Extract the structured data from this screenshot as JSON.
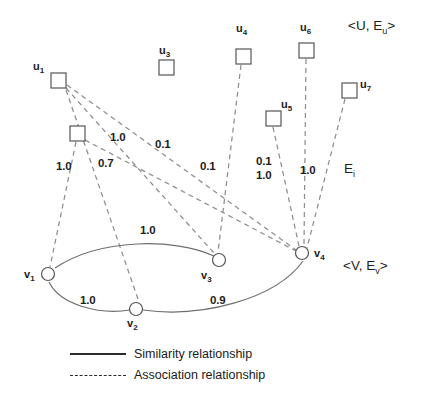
{
  "figure": {
    "colors": {
      "node_stroke": "#555555",
      "solid_edge": "#6e6e6e",
      "dashed_edge": "#8e8e8e",
      "text": "#1d1d1d"
    }
  },
  "set_labels": {
    "upper": {
      "text": "<U, E",
      "sub": "u",
      "tail": ">"
    },
    "middle": {
      "text": "E",
      "sub": "i",
      "tail": ""
    },
    "lower": {
      "text": "<V, E",
      "sub": "v",
      "tail": ">"
    }
  },
  "u_nodes": [
    {
      "id": "u1",
      "label": "u",
      "sub": "1",
      "x": 57,
      "y": 80,
      "show_label": true
    },
    {
      "id": "u2",
      "label": "u",
      "sub": "2",
      "x": 76,
      "y": 133,
      "show_label": false
    },
    {
      "id": "u3",
      "label": "u",
      "sub": "3",
      "x": 166,
      "y": 67,
      "show_label": true
    },
    {
      "id": "u4",
      "label": "u",
      "sub": "4",
      "x": 243,
      "y": 56,
      "show_label": true
    },
    {
      "id": "u5",
      "label": "u",
      "sub": "5",
      "x": 273,
      "y": 118,
      "show_label": true
    },
    {
      "id": "u6",
      "label": "u",
      "sub": "6",
      "x": 306,
      "y": 50,
      "show_label": true
    },
    {
      "id": "u7",
      "label": "u",
      "sub": "7",
      "x": 349,
      "y": 90,
      "show_label": true
    }
  ],
  "v_nodes": [
    {
      "id": "v1",
      "label": "v",
      "sub": "1",
      "x": 48,
      "y": 274
    },
    {
      "id": "v2",
      "label": "v",
      "sub": "2",
      "x": 136,
      "y": 309
    },
    {
      "id": "v3",
      "label": "v",
      "sub": "3",
      "x": 219,
      "y": 260
    },
    {
      "id": "v4",
      "label": "v",
      "sub": "4",
      "x": 302,
      "y": 253
    }
  ],
  "association_edges": [
    {
      "from": "u1",
      "to": "v3",
      "weight": "1.0"
    },
    {
      "from": "u1",
      "to": "v4",
      "weight": "0.1"
    },
    {
      "from": "u1",
      "to": "v2",
      "weight": "0.7"
    },
    {
      "from": "u2",
      "to": "v1",
      "weight": "1.0"
    },
    {
      "from": "u2",
      "to": "v4",
      "weight": "0.1"
    },
    {
      "from": "u4",
      "to": "v3",
      "weight": "0.1"
    },
    {
      "from": "u5",
      "to": "v4",
      "weight": "0.1"
    },
    {
      "from": "u6",
      "to": "v4",
      "weight": "1.0"
    },
    {
      "from": "u7",
      "to": "v4",
      "weight": "1.0"
    }
  ],
  "similarity_edges": [
    {
      "from": "v1",
      "to": "v3",
      "weight": "1.0"
    },
    {
      "from": "v1",
      "to": "v2",
      "weight": "1.0"
    },
    {
      "from": "v2",
      "to": "v4",
      "weight": "0.9"
    }
  ],
  "weight_labels": [
    {
      "value": "1.0",
      "x": 110,
      "y": 131
    },
    {
      "value": "0.1",
      "x": 155,
      "y": 138
    },
    {
      "value": "1.0",
      "x": 56,
      "y": 160
    },
    {
      "value": "0.7",
      "x": 98,
      "y": 157
    },
    {
      "value": "0.1",
      "x": 200,
      "y": 160
    },
    {
      "value": "0.1",
      "x": 256,
      "y": 155
    },
    {
      "value": "1.0",
      "x": 256,
      "y": 169
    },
    {
      "value": "1.0",
      "x": 300,
      "y": 164
    },
    {
      "value": "1.0",
      "x": 140,
      "y": 224
    },
    {
      "value": "1.0",
      "x": 80,
      "y": 294
    },
    {
      "value": "0.9",
      "x": 210,
      "y": 294
    }
  ],
  "legend": {
    "items": [
      {
        "style": "solid",
        "label": "Similarity relationship"
      },
      {
        "style": "dash",
        "label": "Association relationship"
      }
    ]
  }
}
